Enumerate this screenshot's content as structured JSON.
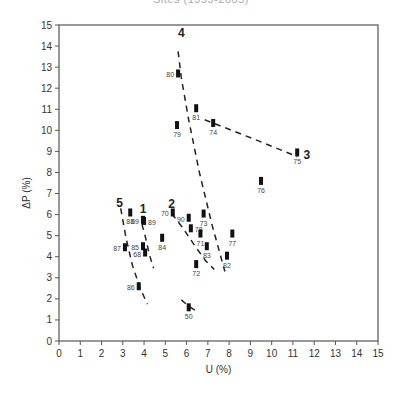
{
  "title": "Sites (1999-2005)",
  "chart_data": {
    "type": "scatter",
    "title": "Sites (1999-2005)",
    "xlabel": "U (%)",
    "ylabel": "ΔP (%)",
    "xlim": [
      0,
      15
    ],
    "ylim": [
      0,
      15
    ],
    "xticks": [
      0,
      1,
      2,
      3,
      4,
      5,
      6,
      7,
      8,
      9,
      10,
      11,
      12,
      13,
      14,
      15
    ],
    "yticks": [
      0,
      1,
      2,
      3,
      4,
      5,
      6,
      7,
      8,
      9,
      10,
      11,
      12,
      13,
      14,
      15
    ],
    "grid": false,
    "legend": "none",
    "points": [
      {
        "label": "80",
        "x": 5.6,
        "y": 12.7,
        "label_pos": "left"
      },
      {
        "label": "81",
        "x": 6.45,
        "y": 11.05,
        "label_pos": "below"
      },
      {
        "label": "79",
        "x": 5.55,
        "y": 10.25,
        "label_pos": "below"
      },
      {
        "label": "74",
        "x": 7.25,
        "y": 10.35,
        "label_pos": "below"
      },
      {
        "label": "75",
        "x": 11.2,
        "y": 8.95,
        "label_pos": "below"
      },
      {
        "label": "76",
        "x": 9.5,
        "y": 7.6,
        "label_pos": "below"
      },
      {
        "label": "88",
        "x": 3.35,
        "y": 6.1,
        "label_pos": "below"
      },
      {
        "label": "69",
        "x": 3.95,
        "y": 5.75,
        "label_pos": "left"
      },
      {
        "label": "89",
        "x": 4.0,
        "y": 5.7,
        "label_pos": "right"
      },
      {
        "label": "70",
        "x": 5.35,
        "y": 6.1,
        "label_pos": "left"
      },
      {
        "label": "90",
        "x": 6.1,
        "y": 5.85,
        "label_pos": "left"
      },
      {
        "label": "73",
        "x": 6.8,
        "y": 6.05,
        "label_pos": "below"
      },
      {
        "label": "78",
        "x": 6.2,
        "y": 5.35,
        "label_pos": "right"
      },
      {
        "label": "71",
        "x": 6.65,
        "y": 5.1,
        "label_pos": "below"
      },
      {
        "label": "77",
        "x": 8.15,
        "y": 5.1,
        "label_pos": "below"
      },
      {
        "label": "84",
        "x": 4.85,
        "y": 4.9,
        "label_pos": "below"
      },
      {
        "label": "85",
        "x": 3.95,
        "y": 4.5,
        "label_pos": "left"
      },
      {
        "label": "87",
        "x": 3.1,
        "y": 4.45,
        "label_pos": "left"
      },
      {
        "label": "68",
        "x": 4.05,
        "y": 4.2,
        "label_pos": "left"
      },
      {
        "label": "83",
        "x": 6.95,
        "y": 4.5,
        "label_pos": "below"
      },
      {
        "label": "82",
        "x": 7.9,
        "y": 4.05,
        "label_pos": "below"
      },
      {
        "label": "72",
        "x": 6.45,
        "y": 3.65,
        "label_pos": "below"
      },
      {
        "label": "86",
        "x": 3.75,
        "y": 2.6,
        "label_pos": "left"
      },
      {
        "label": "50",
        "x": 6.1,
        "y": 1.6,
        "label_pos": "below"
      }
    ],
    "trend_lines": [
      {
        "name": "4",
        "label_at": [
          5.75,
          14.6
        ],
        "path": [
          [
            5.6,
            13.75
          ],
          [
            5.75,
            12.5
          ],
          [
            6.1,
            10.5
          ],
          [
            6.6,
            8.0
          ],
          [
            7.2,
            5.5
          ],
          [
            7.8,
            3.3
          ]
        ]
      },
      {
        "name": "3",
        "label_at": [
          11.65,
          8.85
        ],
        "path": [
          [
            6.85,
            10.5
          ],
          [
            8.0,
            10.05
          ],
          [
            9.5,
            9.45
          ],
          [
            10.6,
            9.0
          ],
          [
            11.2,
            8.75
          ]
        ]
      },
      {
        "name": "5",
        "label_at": [
          2.85,
          6.55
        ],
        "path": [
          [
            2.9,
            6.3
          ],
          [
            3.15,
            4.9
          ],
          [
            3.45,
            3.6
          ],
          [
            3.8,
            2.55
          ],
          [
            4.15,
            1.75
          ]
        ]
      },
      {
        "name": "1",
        "label_at": [
          3.95,
          6.25
        ],
        "path": [
          [
            3.9,
            5.55
          ],
          [
            4.05,
            5.0
          ],
          [
            4.25,
            4.1
          ],
          [
            4.45,
            3.45
          ]
        ]
      },
      {
        "name": "2",
        "label_at": [
          5.3,
          6.5
        ],
        "path": [
          [
            5.3,
            6.05
          ],
          [
            5.8,
            5.4
          ],
          [
            6.4,
            4.5
          ],
          [
            6.9,
            3.8
          ],
          [
            7.3,
            3.4
          ]
        ]
      },
      {
        "name": "",
        "label_at": null,
        "path": [
          [
            5.75,
            1.95
          ],
          [
            6.1,
            1.65
          ],
          [
            6.5,
            1.4
          ]
        ]
      }
    ]
  }
}
